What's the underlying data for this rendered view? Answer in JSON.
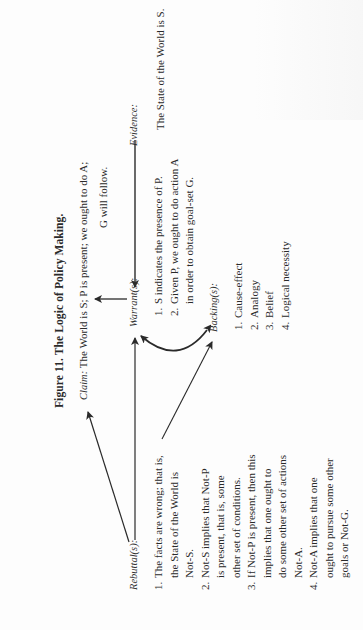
{
  "figure": {
    "title": "Figure 11. The Logic of Policy Making.",
    "orientation": "rotated 90 degrees counter-clockwise"
  },
  "claim": {
    "label": "Claim:",
    "line1": "The World is S; P is present; we ought to do A;",
    "line2": "G will follow."
  },
  "evidence": {
    "label": "Evidence:",
    "text": "The State of the World is S."
  },
  "warrants": {
    "label": "Warrant(s):",
    "items": [
      {
        "num": "1.",
        "lines": [
          "S indicates the presence of P."
        ]
      },
      {
        "num": "2.",
        "lines": [
          "Given P, we ought to do action A",
          "in order to obtain goal-set G."
        ]
      }
    ]
  },
  "backing": {
    "label": "Backing(s):",
    "items": [
      {
        "num": "1.",
        "text": "Cause-effect"
      },
      {
        "num": "2.",
        "text": "Analogy"
      },
      {
        "num": "3.",
        "text": "Belief"
      },
      {
        "num": "4.",
        "text": "Logical necessity"
      }
    ]
  },
  "rebuttals": {
    "label": "Rebuttal(s):",
    "items": [
      {
        "num": "1.",
        "lines": [
          "The facts are wrong; that is,",
          "the State of the World is",
          "Not-S."
        ]
      },
      {
        "num": "2.",
        "lines": [
          "Not-S implies that Not-P",
          "is present, that is, some",
          "other set of conditions."
        ]
      },
      {
        "num": "3.",
        "lines": [
          "If Not-P is present, then this",
          "implies that one ought to",
          "do some other set of actions",
          "Not-A."
        ]
      },
      {
        "num": "4.",
        "lines": [
          "Not-A implies that one",
          "ought to pursue some other",
          "goals or Not-G."
        ]
      }
    ]
  },
  "arrows": [
    {
      "from": "evidence",
      "to": "warrant",
      "type": "straight"
    },
    {
      "from": "warrant",
      "to": "claim",
      "type": "straight"
    },
    {
      "from": "rebuttal",
      "to": "claim",
      "type": "straight"
    },
    {
      "from": "rebuttal",
      "to": "warrant",
      "type": "straight"
    },
    {
      "from": "rebuttal-item-1",
      "to": "backing",
      "type": "straight"
    },
    {
      "from": "backing",
      "to": "warrant",
      "type": "curved-bidirectional"
    }
  ],
  "colors": {
    "ink": "#2a2a2a",
    "paper": "#fdfdfd"
  }
}
